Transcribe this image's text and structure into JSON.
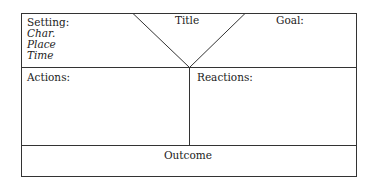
{
  "diagram": {
    "title": "Title",
    "setting": {
      "label": "Setting:",
      "items": [
        "Char.",
        "Place",
        "Time"
      ]
    },
    "goal": "Goal:",
    "actions": "Actions:",
    "reactions": "Reactions:",
    "outcome": "Outcome"
  }
}
